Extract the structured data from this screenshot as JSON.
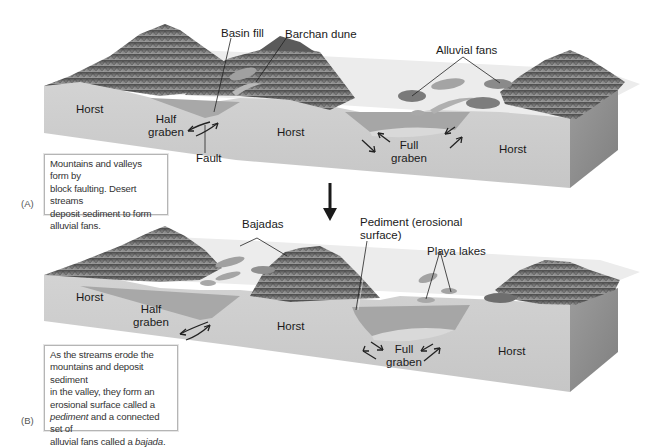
{
  "figure": {
    "panels": [
      {
        "letter": "(A)",
        "caption": "Mountains and valleys form by block faulting. Desert streams deposit sediment to form alluvial fans.",
        "caption_lines": [
          "Mountains and valleys form by",
          "block faulting. Desert streams",
          "deposit sediment to form",
          "alluvial fans."
        ],
        "labels": {
          "basin_fill": "Basin fill",
          "barchan_dune": "Barchan dune",
          "alluvial_fans": "Alluvial fans",
          "horst_left": "Horst",
          "half_graben_1": "Half",
          "half_graben_2": "graben",
          "horst_middle": "Horst",
          "fault": "Fault",
          "full_graben_1": "Full",
          "full_graben_2": "graben",
          "horst_right": "Horst"
        }
      },
      {
        "letter": "(B)",
        "caption_lines": [
          "As the streams erode the",
          "mountains and deposit sediment",
          "in the valley, they form an",
          "erosional surface called a"
        ],
        "caption_line5_italic": "pediment",
        "caption_line5_rest": " and a connected set of",
        "caption_line6_start": "alluvial fans called a ",
        "caption_line6_italic": "bajada",
        "caption_line6_end": ".",
        "labels": {
          "bajadas": "Bajadas",
          "pediment_1": "Pediment (erosional",
          "pediment_2": "surface)",
          "playa_lakes": "Playa lakes",
          "horst_left": "Horst",
          "half_graben_1": "Half",
          "half_graben_2": "graben",
          "horst_middle": "Horst",
          "full_graben_1": "Full",
          "full_graben_2": "graben",
          "horst_right": "Horst"
        }
      }
    ],
    "transition_arrow": "down-arrow",
    "colors": {
      "block_front": "#cfcfcf",
      "block_side": "#8f8f8f",
      "basin_fill": "#a9a9a9",
      "valley_floor": "#e8e8e8",
      "mountain_dark": "#5b5b5b",
      "mountain_mid": "#8a8a8a",
      "lake": "#a3a3a3",
      "text": "#1a1a1a"
    }
  }
}
